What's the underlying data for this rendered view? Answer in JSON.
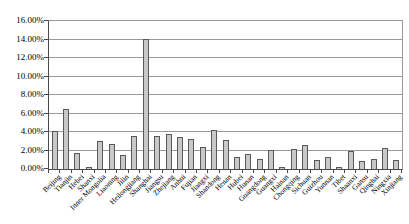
{
  "chart_data": {
    "type": "bar",
    "title": "",
    "xlabel": "",
    "ylabel": "",
    "categories": [
      "Beijing",
      "Tianjin",
      "Hebei",
      "Shanxi",
      "Inner Mongolia",
      "Liaoning",
      "Jilin",
      "Heilongjiang",
      "Shanghai",
      "Jiangsu",
      "Zhejiang",
      "Anhui",
      "Fujian",
      "Jiangxi",
      "Shandong",
      "Henan",
      "Hubei",
      "Hunan",
      "Guangdong",
      "Guangxi",
      "Hainan",
      "Chongqing",
      "Sichuan",
      "Guizhou",
      "Yunnan",
      "Tibet",
      "Shaanxi",
      "Gansu",
      "Qinghai",
      "Ningxia",
      "Xinjiang"
    ],
    "values": [
      4.1,
      6.5,
      1.7,
      0.2,
      3.0,
      2.7,
      1.5,
      3.6,
      14.0,
      3.6,
      3.8,
      3.5,
      3.2,
      2.4,
      4.2,
      3.1,
      1.3,
      1.6,
      1.1,
      2.1,
      0.25,
      2.2,
      2.6,
      1.0,
      1.3,
      0.25,
      1.9,
      0.85,
      1.1,
      2.3,
      0.95
    ],
    "ylim": [
      0,
      16
    ],
    "ytick_step": 2,
    "ytick_labels": [
      "0.00%",
      "2.00%",
      "4.00%",
      "6.00%",
      "8.00%",
      "10.00%",
      "12.00%",
      "14.00%",
      "16.00%"
    ],
    "grid": true,
    "legend": "none",
    "bar_fill": "#c8c8c8",
    "bar_border": "#595959",
    "gridline_color": "#9a9a9a",
    "axis_color": "#4a4a4a",
    "text_color": "#000000"
  }
}
